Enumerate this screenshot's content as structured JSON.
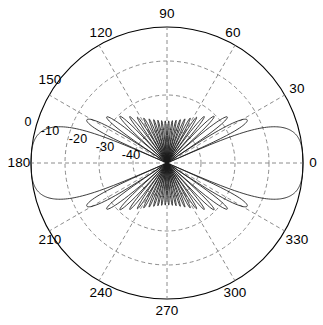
{
  "figure": {
    "name": "polar-radiation-pattern",
    "type": "polar-plot",
    "background_color": "#ffffff",
    "line_color": "#1a1a1a",
    "grid_color": "#808080",
    "axis_color": "#000000"
  },
  "chart_data": {
    "type": "line",
    "plot_style": "polar",
    "title": "",
    "xlabel": "",
    "ylabel": "",
    "angle_unit": "degrees",
    "radial_unit": "dB",
    "angle_tick_labels": [
      "0",
      "30",
      "60",
      "90",
      "120",
      "150",
      "180",
      "210",
      "240",
      "270",
      "300",
      "330"
    ],
    "angle_ticks": [
      0,
      30,
      60,
      90,
      120,
      150,
      180,
      210,
      240,
      270,
      300,
      330
    ],
    "radial_tick_labels": [
      "0",
      "-10",
      "-20",
      "-30",
      "-40"
    ],
    "radial_ticks": [
      0,
      -10,
      -20,
      -30,
      -40
    ],
    "rlim": [
      -40,
      0
    ],
    "grid": true,
    "legend": null,
    "center": {
      "x": 167,
      "y": 163
    },
    "outer_radius": 136,
    "grid_rings": [
      136,
      102,
      68,
      34
    ],
    "series": [
      {
        "name": "array-pattern",
        "num_elements": 24,
        "beam_direction_deg": 0,
        "mainlobe_peak_db": 0,
        "angles_deg": [
          0,
          5,
          10,
          15,
          20,
          25,
          30,
          35,
          40,
          45,
          50,
          55,
          60,
          65,
          70,
          75,
          80,
          85,
          90,
          95,
          100,
          105,
          110,
          115,
          120,
          125,
          130,
          135,
          140,
          145,
          150,
          155,
          160,
          165,
          170,
          175,
          180
        ],
        "values_db": [
          0,
          -3.2,
          -13.5,
          -40,
          -17.8,
          -22.5,
          -40,
          -21.5,
          -24.5,
          -40,
          -23.0,
          -25.5,
          -40,
          -24.0,
          -26.0,
          -40,
          -24.5,
          -26.5,
          -40,
          -25.0,
          -27.0,
          -40,
          -25.2,
          -27.2,
          -40,
          -25.4,
          -27.4,
          -40,
          -25.5,
          -27.5,
          -40,
          -25.6,
          -27.6,
          -40,
          -25.8,
          -28.0,
          -40
        ]
      }
    ]
  },
  "labels": {
    "angles": [
      {
        "name": "angle-label-0",
        "text": "0",
        "x": 313,
        "y": 163
      },
      {
        "name": "angle-label-30",
        "text": "30",
        "x": 297,
        "y": 89
      },
      {
        "name": "angle-label-60",
        "text": "60",
        "x": 233,
        "y": 33
      },
      {
        "name": "angle-label-90",
        "text": "90",
        "x": 167,
        "y": 14
      },
      {
        "name": "angle-label-120",
        "text": "120",
        "x": 101,
        "y": 33
      },
      {
        "name": "angle-label-150",
        "text": "150",
        "x": 50,
        "y": 80
      },
      {
        "name": "angle-label-180",
        "text": "180",
        "x": 19,
        "y": 163
      },
      {
        "name": "angle-label-210",
        "text": "210",
        "x": 50,
        "y": 240
      },
      {
        "name": "angle-label-240",
        "text": "240",
        "x": 101,
        "y": 293
      },
      {
        "name": "angle-label-270",
        "text": "270",
        "x": 167,
        "y": 311
      },
      {
        "name": "angle-label-300",
        "text": "300",
        "x": 235,
        "y": 293
      },
      {
        "name": "angle-label-330",
        "text": "330",
        "x": 297,
        "y": 240
      }
    ],
    "radials": [
      {
        "name": "radial-label-0",
        "text": "0",
        "x": 28,
        "y": 122
      },
      {
        "name": "radial-label-m10",
        "text": "-10",
        "x": 50,
        "y": 131
      },
      {
        "name": "radial-label-m20",
        "text": "-20",
        "x": 78,
        "y": 139
      },
      {
        "name": "radial-label-m30",
        "text": "-30",
        "x": 105,
        "y": 147
      },
      {
        "name": "radial-label-m40",
        "text": "-40",
        "x": 131,
        "y": 155
      }
    ]
  }
}
